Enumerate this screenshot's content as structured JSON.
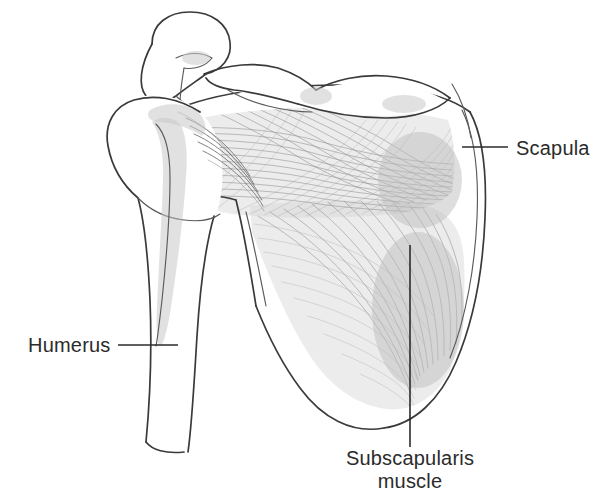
{
  "figure": {
    "background_color": "#ffffff",
    "line_color": "#3a3a3a",
    "text_color": "#2b2b2b",
    "muscle_fill_color": "#d8d8d8",
    "fiber_color": "#8d8d8d"
  },
  "labels": {
    "scapula": {
      "text": "Scapula",
      "x": 516,
      "y": 155,
      "anchor": "start",
      "leader": {
        "x1": 462,
        "y1": 147,
        "x2": 508,
        "y2": 147
      }
    },
    "humerus": {
      "text": "Humerus",
      "x": 28,
      "y": 352,
      "anchor": "start",
      "leader": {
        "x1": 118,
        "y1": 345,
        "x2": 178,
        "y2": 345
      }
    },
    "subscapularis": {
      "line1": "Subscapularis",
      "line2": "muscle",
      "x": 410,
      "y1": 465,
      "y2": 488,
      "anchor": "middle",
      "leader": {
        "x1": 410,
        "y1": 245,
        "x2": 410,
        "y2": 447
      }
    }
  },
  "structures": [
    {
      "name": "coracoid-process",
      "label": "Coracoid process"
    },
    {
      "name": "acromion",
      "label": "Acromion"
    },
    {
      "name": "clavicle",
      "label": "Clavicle"
    },
    {
      "name": "humeral-head",
      "label": "Humeral head"
    },
    {
      "name": "humeral-shaft",
      "label": "Humeral shaft"
    },
    {
      "name": "bicipital-groove",
      "label": "Bicipital groove"
    },
    {
      "name": "glenoid-neck",
      "label": "Glenoid neck"
    },
    {
      "name": "scapula-lateral-border",
      "label": "Lateral border of scapula"
    },
    {
      "name": "scapula-medial-border",
      "label": "Medial border of scapula"
    },
    {
      "name": "inferior-angle",
      "label": "Inferior angle"
    },
    {
      "name": "subscapularis-muscle-belly",
      "label": "Subscapularis muscle belly"
    },
    {
      "name": "subscapularis-tendon",
      "label": "Subscapularis tendon insertion"
    }
  ]
}
